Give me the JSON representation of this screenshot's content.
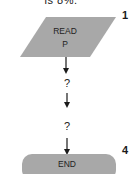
{
  "caption": {
    "text": "is 8%."
  },
  "flowchart": {
    "nodes": [
      {
        "id": "read",
        "type": "parallelogram",
        "lines": [
          "READ",
          "P"
        ],
        "step": "1"
      },
      {
        "id": "q1",
        "type": "unknown",
        "label": "?"
      },
      {
        "id": "q2",
        "type": "unknown",
        "label": "?"
      },
      {
        "id": "end",
        "type": "terminator",
        "label": "END",
        "step": "4"
      }
    ],
    "colors": {
      "shape_fill": "#a8a8a8",
      "line": "#1a1a1a",
      "background": "#ffffff"
    }
  }
}
